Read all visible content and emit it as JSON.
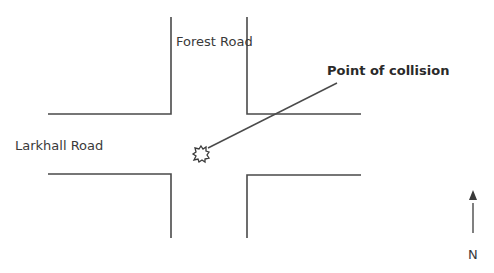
{
  "diagram": {
    "roads": [
      {
        "name": "Forest Road",
        "orientation": "north-south"
      },
      {
        "name": "Larkhall Road",
        "orientation": "east-west"
      }
    ],
    "annotation": "Point of collision",
    "compass": {
      "label": "N",
      "direction": "north"
    },
    "colors": {
      "line": "#4a4a4a",
      "text": "#3a3a3a",
      "background": "#ffffff"
    }
  }
}
